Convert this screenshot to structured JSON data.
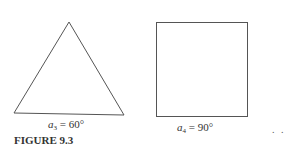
{
  "figure": {
    "caption": "FIGURE 9.3",
    "shapes": [
      {
        "type": "triangle",
        "label_var": "a",
        "label_sub": "3",
        "label_rest": " = 60°"
      },
      {
        "type": "square",
        "label_var": "a",
        "label_sub": "4",
        "label_rest": " = 90°"
      }
    ],
    "continuation": ". ."
  }
}
